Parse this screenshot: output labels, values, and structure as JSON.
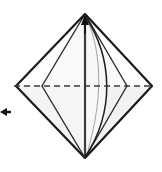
{
  "figure": {
    "description": "Diamond-shaped folded paper seen from the front with a horizontal valley-fold dashed line, vertical center crease, curved edge bulge, an upward arrowhead at the top point and a small left-pointing direction arrow at the left margin.",
    "background_color": "#ffffff",
    "paper_fill": "#f7f7f7",
    "paper_fill_shaded": "#ededed",
    "paper_fill_light": "#fbfbfb",
    "outline_color": "#1a1a1a",
    "crease_color": "#2b2b2b",
    "dashed_color": "#3a3a3a",
    "arrow_color": "#111111",
    "canvas": {
      "width": 162,
      "height": 172
    }
  },
  "geometry": {
    "diamond": {
      "top": {
        "x": 85,
        "y": 14
      },
      "right": {
        "x": 152,
        "y": 86
      },
      "bottom": {
        "x": 85,
        "y": 158
      },
      "left": {
        "x": 16,
        "y": 86
      }
    },
    "inner_square": {
      "top": {
        "x": 85,
        "y": 14
      },
      "right": {
        "x": 127,
        "y": 86
      },
      "bottom": {
        "x": 85,
        "y": 158
      },
      "left": {
        "x": 42,
        "y": 86
      }
    },
    "center_crease": {
      "x1": 85,
      "y1": 14,
      "x2": 85,
      "y2": 158
    },
    "dashed_line": {
      "x1": 14,
      "y1": 86,
      "x2": 154,
      "y2": 86
    },
    "curve": {
      "start_x": 85,
      "start_y": 16,
      "end_x": 85,
      "end_y": 157,
      "bulge_x": 122
    }
  },
  "labels": {
    "top_arrow": "up-arrow-top-point",
    "left_arrow": "left-direction-arrow",
    "dashed_fold": "valley-fold-dashed-line",
    "center_crease": "vertical-center-crease",
    "curved_edge": "curved-raw-edge",
    "paper_body": "diamond-paper-shape"
  },
  "legend": {
    "dash_pattern": "6 4",
    "outline_width": "2",
    "crease_width": "1.4",
    "dash_width": "1.6"
  }
}
